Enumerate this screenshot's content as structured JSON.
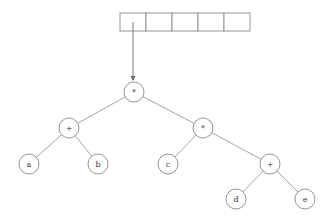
{
  "diagram": {
    "type": "expression-tree",
    "array": {
      "cells": [
        "",
        "",
        "",
        "",
        ""
      ],
      "pointer_from_cell": 0,
      "pointer_to": "root"
    },
    "nodes": [
      {
        "id": "root",
        "label": "*"
      },
      {
        "id": "plus_left",
        "label": "+"
      },
      {
        "id": "times_right",
        "label": "*"
      },
      {
        "id": "a",
        "label": "a"
      },
      {
        "id": "b",
        "label": "b"
      },
      {
        "id": "c",
        "label": "c"
      },
      {
        "id": "plus_right",
        "label": "+"
      },
      {
        "id": "d",
        "label": "d"
      },
      {
        "id": "e",
        "label": "e"
      }
    ],
    "edges": [
      [
        "root",
        "plus_left"
      ],
      [
        "root",
        "times_right"
      ],
      [
        "plus_left",
        "a"
      ],
      [
        "plus_left",
        "b"
      ],
      [
        "times_right",
        "c"
      ],
      [
        "times_right",
        "plus_right"
      ],
      [
        "plus_right",
        "d"
      ],
      [
        "plus_right",
        "e"
      ]
    ],
    "expression": "(a + b) * (c * (d + e))"
  },
  "colors": {
    "stroke": "#8a8a8a",
    "text": "#333333",
    "background": "#ffffff"
  }
}
